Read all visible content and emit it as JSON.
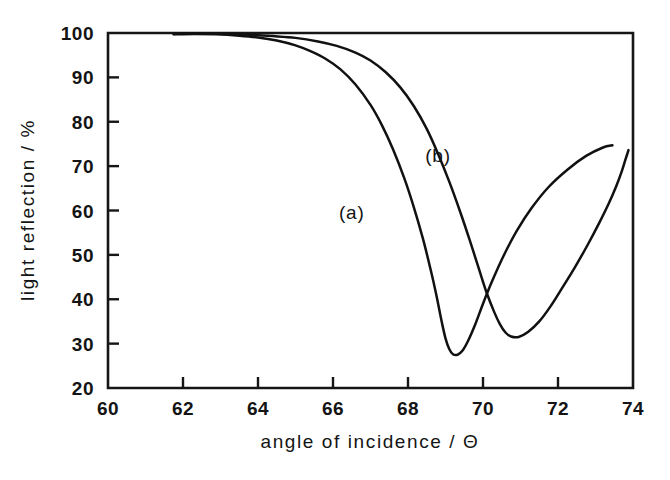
{
  "chart_data": {
    "type": "line",
    "title": "",
    "xlabel": "angle of incidence / Θ",
    "ylabel": "light reflection / %",
    "xlim": [
      60,
      74
    ],
    "ylim": [
      20,
      100
    ],
    "xticks": [
      60,
      62,
      64,
      66,
      68,
      70,
      72,
      74
    ],
    "xtick_labels": [
      "60",
      "62",
      "64",
      "66",
      "68",
      "70",
      "72",
      "74"
    ],
    "yticks": [
      20,
      30,
      40,
      50,
      60,
      70,
      80,
      90,
      100
    ],
    "ytick_labels": [
      "20",
      "30",
      "40",
      "50",
      "60",
      "70",
      "80",
      "90",
      "100"
    ],
    "grid": false,
    "legend": "inline-annotations",
    "annotations": [
      {
        "text": "(a)",
        "x": 66.5,
        "y": 58
      },
      {
        "text": "(b)",
        "x": 68.8,
        "y": 71
      }
    ],
    "series": [
      {
        "name": "(a)",
        "label": "(a)",
        "color": "#111111",
        "points": [
          [
            61.75,
            99.7
          ],
          [
            62.3,
            99.8
          ],
          [
            62.9,
            99.7
          ],
          [
            63.5,
            99.4
          ],
          [
            64.0,
            99.0
          ],
          [
            64.5,
            98.3
          ],
          [
            65.0,
            97.2
          ],
          [
            65.4,
            95.9
          ],
          [
            65.8,
            94.2
          ],
          [
            66.2,
            91.8
          ],
          [
            66.6,
            88.4
          ],
          [
            67.0,
            83.8
          ],
          [
            67.3,
            79.3
          ],
          [
            67.6,
            73.8
          ],
          [
            67.9,
            67.3
          ],
          [
            68.15,
            60.9
          ],
          [
            68.4,
            53.6
          ],
          [
            68.6,
            46.8
          ],
          [
            68.75,
            41.2
          ],
          [
            68.9,
            34.9
          ],
          [
            69.0,
            31.2
          ],
          [
            69.1,
            28.8
          ],
          [
            69.2,
            27.6
          ],
          [
            69.32,
            27.5
          ],
          [
            69.45,
            28.4
          ],
          [
            69.6,
            30.6
          ],
          [
            69.8,
            34.5
          ],
          [
            70.0,
            39.0
          ],
          [
            70.25,
            44.2
          ],
          [
            70.55,
            49.8
          ],
          [
            70.9,
            55.4
          ],
          [
            71.3,
            60.6
          ],
          [
            71.75,
            65.3
          ],
          [
            72.25,
            69.2
          ],
          [
            72.75,
            72.3
          ],
          [
            73.2,
            74.2
          ],
          [
            73.45,
            74.7
          ]
        ]
      },
      {
        "name": "(b)",
        "label": "(b)",
        "color": "#111111",
        "points": [
          [
            61.75,
            99.8
          ],
          [
            62.4,
            99.9
          ],
          [
            63.1,
            99.8
          ],
          [
            63.8,
            99.6
          ],
          [
            64.4,
            99.3
          ],
          [
            65.0,
            98.9
          ],
          [
            65.6,
            98.1
          ],
          [
            66.1,
            97.1
          ],
          [
            66.6,
            95.6
          ],
          [
            67.0,
            93.8
          ],
          [
            67.4,
            91.2
          ],
          [
            67.8,
            87.7
          ],
          [
            68.15,
            83.6
          ],
          [
            68.5,
            78.4
          ],
          [
            68.8,
            72.8
          ],
          [
            69.1,
            66.5
          ],
          [
            69.4,
            59.5
          ],
          [
            69.65,
            53.2
          ],
          [
            69.9,
            46.6
          ],
          [
            70.1,
            41.4
          ],
          [
            70.3,
            37.1
          ],
          [
            70.45,
            34.4
          ],
          [
            70.6,
            32.5
          ],
          [
            70.75,
            31.6
          ],
          [
            70.95,
            31.5
          ],
          [
            71.2,
            32.6
          ],
          [
            71.5,
            35.0
          ],
          [
            71.8,
            38.4
          ],
          [
            72.1,
            42.4
          ],
          [
            72.45,
            47.2
          ],
          [
            72.8,
            52.4
          ],
          [
            73.1,
            57.2
          ],
          [
            73.35,
            61.5
          ],
          [
            73.55,
            65.4
          ],
          [
            73.7,
            68.8
          ],
          [
            73.8,
            71.5
          ],
          [
            73.88,
            73.6
          ]
        ]
      }
    ]
  },
  "axes": {
    "frame_color": "#161616",
    "x_axis_title": "angle of incidence / Θ",
    "y_axis_title": "light reflection / %"
  }
}
